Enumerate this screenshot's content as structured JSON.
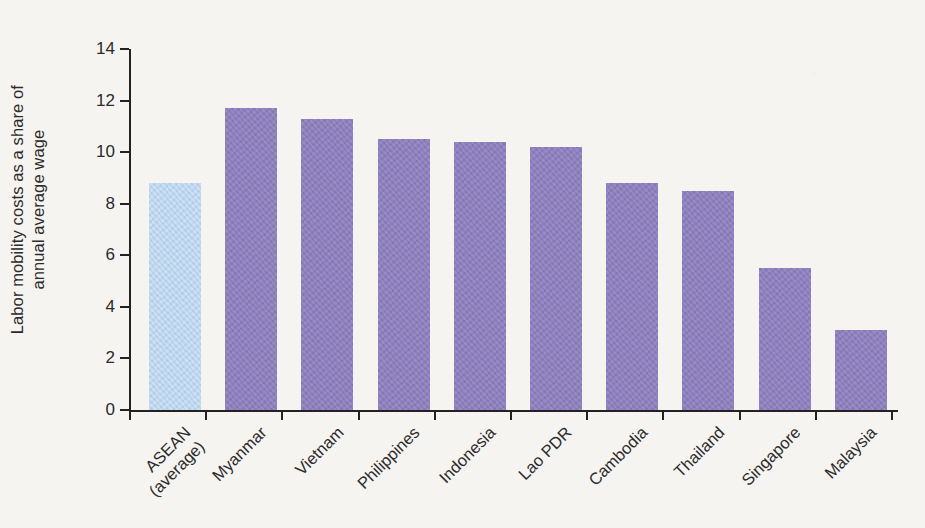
{
  "figure": {
    "background_color": "#f6f4f1",
    "axis_color": "#222222",
    "text_color": "#2b2b2b"
  },
  "axis": {
    "y_title_line1": "Labor mobility costs as a share of",
    "y_title_line2": "annual average wage",
    "y_ticks": [
      "0",
      "2",
      "4",
      "6",
      "8",
      "10",
      "12",
      "14"
    ]
  },
  "chart_data": {
    "type": "bar",
    "title": "",
    "xlabel": "",
    "ylabel": "Labor mobility costs as a share of annual average wage",
    "ylim": [
      0,
      14
    ],
    "ytick_values": [
      0,
      2,
      4,
      6,
      8,
      10,
      12,
      14
    ],
    "grid": false,
    "legend": null,
    "categories": [
      "ASEAN (average)",
      "Myanmar",
      "Vietnam",
      "Philippines",
      "Indonesia",
      "Lao PDR",
      "Cambodia",
      "Thailand",
      "Singapore",
      "Malaysia"
    ],
    "category_lines": [
      [
        "ASEAN",
        "(average)"
      ],
      [
        "Myanmar"
      ],
      [
        "Vietnam"
      ],
      [
        "Philippines"
      ],
      [
        "Indonesia"
      ],
      [
        "Lao PDR"
      ],
      [
        "Cambodia"
      ],
      [
        "Thailand"
      ],
      [
        "Singapore"
      ],
      [
        "Malaysia"
      ]
    ],
    "values": [
      8.8,
      11.7,
      11.3,
      10.5,
      10.4,
      10.2,
      8.8,
      8.5,
      5.5,
      3.1
    ],
    "colors": [
      "#bad6f1",
      "#8c7ebf",
      "#8c7ebf",
      "#8c7ebf",
      "#8c7ebf",
      "#8c7ebf",
      "#8c7ebf",
      "#8c7ebf",
      "#8c7ebf",
      "#8c7ebf"
    ],
    "highlight_color": "#bad6f1",
    "series_color": "#8c7ebf"
  }
}
